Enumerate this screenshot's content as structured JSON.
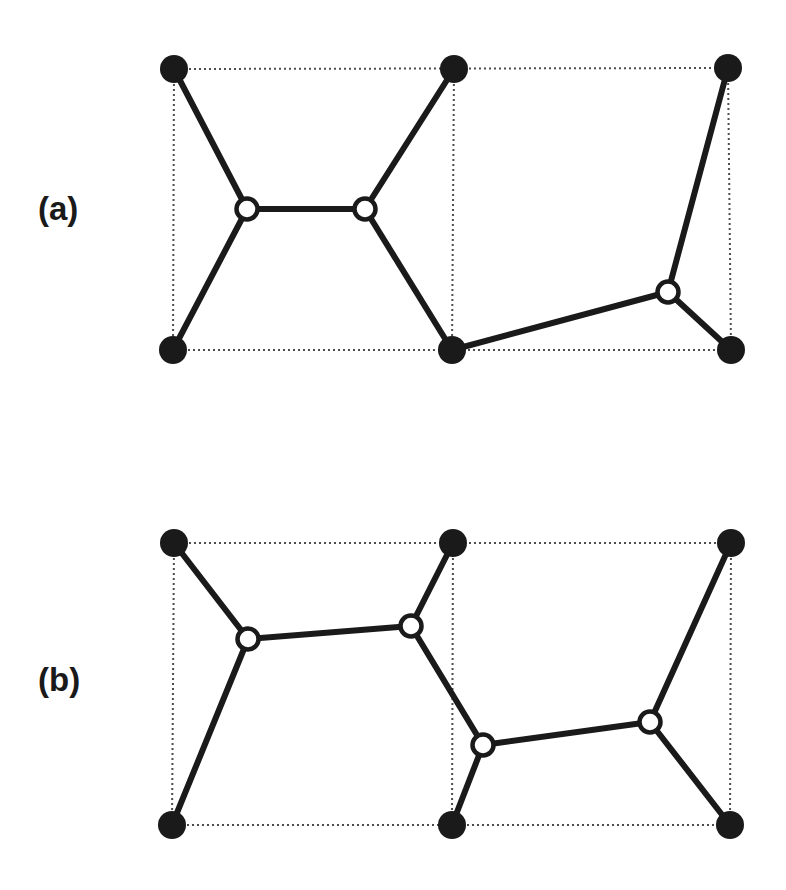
{
  "figure": {
    "background_color": "#ffffff",
    "width": 786,
    "height": 890,
    "filled_node_color": "#1a1a1a",
    "open_node_stroke_color": "#1a1a1a",
    "open_node_fill_color": "#ffffff",
    "bond_color": "#1a1a1a",
    "cell_boundary_color": "#4d4d4d",
    "bond_width": 6,
    "cell_boundary_width": 2,
    "cell_boundary_dash": "2 3",
    "filled_node_radius": 14,
    "open_node_radius": 10.5,
    "open_node_stroke_width": 4.5
  },
  "panels": [
    {
      "id": "a",
      "label": "(a)",
      "label_x": 38,
      "label_y": 192,
      "cell": {
        "left": 174,
        "right": 731,
        "top": 69,
        "bottom": 350,
        "mid_divider_x": 453
      },
      "filled_nodes": [
        {
          "name": "a-top-left",
          "x": 174,
          "y": 69
        },
        {
          "name": "a-top-middle",
          "x": 454,
          "y": 69
        },
        {
          "name": "a-top-right",
          "x": 728,
          "y": 68
        },
        {
          "name": "a-bottom-left",
          "x": 173,
          "y": 350
        },
        {
          "name": "a-bottom-middle",
          "x": 452,
          "y": 350
        },
        {
          "name": "a-bottom-right",
          "x": 731,
          "y": 350
        }
      ],
      "open_nodes": [
        {
          "name": "a-open-left",
          "x": 247,
          "y": 209
        },
        {
          "name": "a-open-right",
          "x": 365,
          "y": 209
        },
        {
          "name": "a-open-far",
          "x": 668,
          "y": 292
        }
      ],
      "bonds": [
        {
          "name": "a-bond-tl-ol",
          "x1": 174,
          "y1": 69,
          "x2": 247,
          "y2": 209
        },
        {
          "name": "a-bond-ol-or",
          "x1": 247,
          "y1": 209,
          "x2": 365,
          "y2": 209
        },
        {
          "name": "a-bond-or-tm",
          "x1": 365,
          "y1": 209,
          "x2": 454,
          "y2": 69
        },
        {
          "name": "a-bond-ol-bl",
          "x1": 247,
          "y1": 209,
          "x2": 173,
          "y2": 350
        },
        {
          "name": "a-bond-or-bm",
          "x1": 365,
          "y1": 209,
          "x2": 452,
          "y2": 350
        },
        {
          "name": "a-bond-bm-of",
          "x1": 452,
          "y1": 350,
          "x2": 668,
          "y2": 292
        },
        {
          "name": "a-bond-of-tr",
          "x1": 668,
          "y1": 292,
          "x2": 728,
          "y2": 68
        },
        {
          "name": "a-bond-of-br",
          "x1": 668,
          "y1": 292,
          "x2": 731,
          "y2": 350
        }
      ],
      "cell_edges": [
        {
          "name": "a-cell-top",
          "x1": 174,
          "y1": 69,
          "x2": 731,
          "y2": 68
        },
        {
          "name": "a-cell-bottom",
          "x1": 173,
          "y1": 350,
          "x2": 731,
          "y2": 350
        },
        {
          "name": "a-cell-left",
          "x1": 174,
          "y1": 69,
          "x2": 173,
          "y2": 350
        },
        {
          "name": "a-cell-middle",
          "x1": 454,
          "y1": 69,
          "x2": 452,
          "y2": 350
        },
        {
          "name": "a-cell-right",
          "x1": 728,
          "y1": 68,
          "x2": 731,
          "y2": 350
        }
      ]
    },
    {
      "id": "b",
      "label": "(b)",
      "label_x": 38,
      "label_y": 663,
      "cell": {
        "left": 174,
        "right": 731,
        "top": 543,
        "bottom": 825,
        "mid_divider_x": 453
      },
      "filled_nodes": [
        {
          "name": "b-top-left",
          "x": 174,
          "y": 543
        },
        {
          "name": "b-top-middle",
          "x": 453,
          "y": 543
        },
        {
          "name": "b-top-right",
          "x": 731,
          "y": 543
        },
        {
          "name": "b-bottom-left",
          "x": 172,
          "y": 825
        },
        {
          "name": "b-bottom-middle",
          "x": 452,
          "y": 825
        },
        {
          "name": "b-bottom-right",
          "x": 730,
          "y": 825
        }
      ],
      "open_nodes": [
        {
          "name": "b-open-upper-left",
          "x": 248,
          "y": 639
        },
        {
          "name": "b-open-upper-right",
          "x": 411,
          "y": 626
        },
        {
          "name": "b-open-lower-left",
          "x": 483,
          "y": 745
        },
        {
          "name": "b-open-lower-right",
          "x": 650,
          "y": 722
        }
      ],
      "bonds": [
        {
          "name": "b-bond-tl-oul",
          "x1": 174,
          "y1": 543,
          "x2": 248,
          "y2": 639
        },
        {
          "name": "b-bond-oul-our",
          "x1": 248,
          "y1": 639,
          "x2": 411,
          "y2": 626
        },
        {
          "name": "b-bond-our-tm",
          "x1": 411,
          "y1": 626,
          "x2": 453,
          "y2": 543
        },
        {
          "name": "b-bond-oul-bl",
          "x1": 248,
          "y1": 639,
          "x2": 172,
          "y2": 825
        },
        {
          "name": "b-bond-our-oll",
          "x1": 411,
          "y1": 626,
          "x2": 483,
          "y2": 745
        },
        {
          "name": "b-bond-oll-bm",
          "x1": 483,
          "y1": 745,
          "x2": 452,
          "y2": 825
        },
        {
          "name": "b-bond-oll-olr",
          "x1": 483,
          "y1": 745,
          "x2": 650,
          "y2": 722
        },
        {
          "name": "b-bond-olr-tr",
          "x1": 650,
          "y1": 722,
          "x2": 731,
          "y2": 543
        },
        {
          "name": "b-bond-olr-br",
          "x1": 650,
          "y1": 722,
          "x2": 730,
          "y2": 825
        }
      ],
      "cell_edges": [
        {
          "name": "b-cell-top",
          "x1": 174,
          "y1": 543,
          "x2": 731,
          "y2": 543
        },
        {
          "name": "b-cell-bottom",
          "x1": 172,
          "y1": 825,
          "x2": 730,
          "y2": 825
        },
        {
          "name": "b-cell-left",
          "x1": 174,
          "y1": 543,
          "x2": 172,
          "y2": 825
        },
        {
          "name": "b-cell-middle",
          "x1": 453,
          "y1": 543,
          "x2": 452,
          "y2": 825
        },
        {
          "name": "b-cell-right",
          "x1": 731,
          "y1": 543,
          "x2": 730,
          "y2": 825
        }
      ]
    }
  ]
}
